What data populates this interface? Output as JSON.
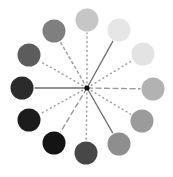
{
  "diagram": {
    "type": "radial-color-wheel",
    "center": {
      "x": 87,
      "y": 88
    },
    "circle_radius": 11.5,
    "spokes": [
      {
        "position": "12 o'clock",
        "x": 87,
        "y": 20,
        "color": "#c6c6c6",
        "line": "dotted"
      },
      {
        "position": "1 o'clock",
        "x": 119,
        "y": 30,
        "color": "#e6e6e6",
        "line": "solid"
      },
      {
        "position": "2 o'clock",
        "x": 143,
        "y": 54,
        "color": "#e3e3e3",
        "line": "dotted"
      },
      {
        "position": "3 o'clock",
        "x": 153,
        "y": 89,
        "color": "#b2b2b2",
        "line": "long-dash"
      },
      {
        "position": "4 o'clock",
        "x": 142,
        "y": 121,
        "color": "#9b9b9b",
        "line": "dotted"
      },
      {
        "position": "5 o'clock",
        "x": 119,
        "y": 144,
        "color": "#8e8e8e",
        "line": "solid"
      },
      {
        "position": "6 o'clock",
        "x": 86,
        "y": 153,
        "color": "#474747",
        "line": "dotted"
      },
      {
        "position": "7 o'clock",
        "x": 54,
        "y": 143,
        "color": "#141414",
        "line": "long-dash"
      },
      {
        "position": "8 o'clock",
        "x": 29,
        "y": 120,
        "color": "#1c1c1c",
        "line": "dotted"
      },
      {
        "position": "9 o'clock",
        "x": 22,
        "y": 88,
        "color": "#2b2b2b",
        "line": "solid"
      },
      {
        "position": "10 o'clock",
        "x": 29,
        "y": 55,
        "color": "#5c5c5c",
        "line": "dotted"
      },
      {
        "position": "11 o'clock",
        "x": 54,
        "y": 31,
        "color": "#7f7f7f",
        "line": "dashed"
      }
    ],
    "line_color": "#9a9a9a",
    "solid_line_color": "#6e6e6e",
    "center_dot_color": "#111111"
  }
}
